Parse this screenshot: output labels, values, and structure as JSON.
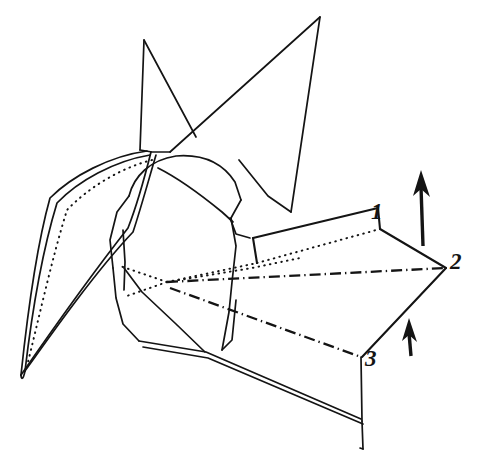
{
  "figure": {
    "background_color": "#ffffff",
    "ink_color": "#141414",
    "width": 480,
    "height": 466
  },
  "labels": [
    {
      "id": "1",
      "text": "1",
      "x": 371,
      "y": 200
    },
    {
      "id": "2",
      "text": "2",
      "x": 450,
      "y": 250
    },
    {
      "id": "3",
      "text": "3",
      "x": 365,
      "y": 347
    }
  ],
  "arrows": [
    {
      "name": "large-up-arrow",
      "direction": "up",
      "shaft": {
        "x1": 423,
        "y1": 246,
        "x2": 421,
        "y2": 186
      },
      "head_points": "421,170 414,192 421,187 429,194"
    },
    {
      "name": "small-up-arrow",
      "direction": "up",
      "shaft": {
        "x1": 411,
        "y1": 356,
        "x2": 410,
        "y2": 331
      },
      "head_points": "410,318 403,338 410,334 417,340"
    }
  ],
  "line_styles": {
    "solid": "solid paper edge",
    "dotted": "hidden / behind-layer fold edge",
    "dash_dot": "reference axis fold line"
  },
  "paths": {
    "head_spike": "M144,39 L141,148 L196,135 Z",
    "tail_spike": "M319,17 L238,148 L291,210 Z",
    "left_wing_outer": "M20,376 L49,195 L147,150",
    "left_wing_inner": "M24,372 L56,200 L150,152",
    "left_wing_dotted": "M21,366 L60,205 L150,157",
    "left_wing_fold": "M20,376 L128,226 L149,152",
    "left_wing_fold2": "M24,372 L132,229 L152,155",
    "body_top": "M141,170 L178,155 L222,159 L241,198 L230,215",
    "body_left": "M118,182 L108,238 L112,268 L118,300 L138,340",
    "body_right": "M230,215 L237,244 L232,280 L228,312 L222,350",
    "body_bottom": "M138,340 L176,350 L205,352 L222,350",
    "center_dotted_arc": "M160,168 L196,186 L228,212",
    "bottom_panel_top": "M138,340 L205,352 L360,418",
    "bottom_panel_top2": "M141,345 L208,357 L363,423",
    "bottom_panel_right": "M360,418 L362,448",
    "upper_flap_top": "M253,238 L378,208",
    "upper_flap_right": "M378,208 L379,228",
    "upper_flap_left": "M253,238 L256,262",
    "upper_flap_dotted": "M256,262 L379,228",
    "mid_right_edge": "M379,228 L446,268",
    "lower_right_edge": "M446,268 L362,358",
    "lower_panel_dashdot": "M168,283 L362,358",
    "axis_dashdot": "M166,281 L446,268",
    "panel3_right": "M362,358 L363,423",
    "converging_dotted_1": "M166,281 L256,262 L379,228",
    "converging_dotted_2": "M166,281 L240,296 L362,358",
    "converging_dotted_3": "M166,281 L120,268",
    "converging_dotted_4": "M166,281 L124,296"
  }
}
